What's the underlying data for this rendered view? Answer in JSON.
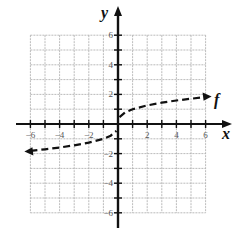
{
  "chart_data": {
    "type": "line",
    "title": "",
    "xlabel": "x",
    "ylabel": "y",
    "xlim": [
      -6,
      6
    ],
    "ylim": [
      -6,
      6
    ],
    "grid": true,
    "x_ticks": [
      -6,
      -4,
      -2,
      2,
      4,
      6
    ],
    "y_ticks": [
      -6,
      -4,
      -2,
      2,
      4,
      6
    ],
    "series": [
      {
        "name": "f",
        "style": "dashed",
        "arrows": "both",
        "x": [
          -6,
          -5,
          -4,
          -3,
          -2,
          -1,
          -0.5,
          -0.1,
          0.1,
          0.5,
          1,
          2,
          3,
          4,
          5,
          6
        ],
        "y": [
          -1.82,
          -1.71,
          -1.59,
          -1.44,
          -1.26,
          -1.0,
          -0.79,
          -0.46,
          0.46,
          0.79,
          1.0,
          1.26,
          1.44,
          1.59,
          1.71,
          1.82
        ]
      }
    ],
    "annotations": [
      {
        "text": "f",
        "x": 6.6,
        "y": 1.8
      }
    ]
  },
  "labels": {
    "x_axis": "x",
    "y_axis": "y",
    "curve": "f"
  }
}
